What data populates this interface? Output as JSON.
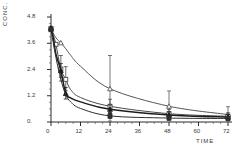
{
  "chart_data": {
    "type": "line",
    "title": "",
    "xlabel": "TIME",
    "ylabel": "CONC.",
    "xlim": [
      0,
      72
    ],
    "ylim": [
      0,
      4.8
    ],
    "xticks": [
      0,
      12,
      24,
      36,
      48,
      60,
      72
    ],
    "xtick_labels": [
      "0",
      "12",
      "24",
      "36",
      "48",
      "60",
      "72"
    ],
    "yticks": [
      0,
      1.2,
      2.4,
      3.6,
      4.8
    ],
    "ytick_labels": [
      "0.",
      "1.2",
      "2.4",
      "3.6",
      "4.8"
    ],
    "grid": false,
    "legend": "none",
    "x_minor_ticks": [
      3,
      6,
      9,
      15,
      18,
      21,
      27,
      30,
      33,
      39,
      42,
      45,
      51,
      54,
      57,
      63,
      66,
      69
    ],
    "y_minor_ticks": [
      0.3,
      0.6,
      0.9,
      1.5,
      1.8,
      2.1,
      2.7,
      3.0,
      3.3,
      3.9,
      4.2,
      4.5
    ],
    "series": [
      {
        "name": "curve-a",
        "marker": "open-triangle",
        "color": "#555555",
        "x": [
          0,
          2,
          4,
          6,
          8,
          12,
          24,
          48,
          72
        ],
        "y": [
          4.25,
          3.85,
          3.62,
          3.35,
          3.05,
          2.55,
          1.52,
          0.72,
          0.34
        ],
        "points_x": [
          0,
          4,
          24,
          48,
          72
        ],
        "points_y": [
          4.25,
          3.62,
          1.52,
          0.72,
          0.34
        ],
        "err_x": [
          24,
          48,
          72
        ],
        "err_lo": [
          1.48,
          0.66,
          0.3
        ],
        "err_hi": [
          1.52,
          0.7,
          0.36
        ]
      },
      {
        "name": "curve-b",
        "marker": "open-square",
        "color": "#4a4a4a",
        "x": [
          0,
          1,
          2,
          4,
          6,
          8,
          12,
          24,
          48,
          72
        ],
        "y": [
          4.28,
          3.95,
          3.55,
          2.42,
          1.95,
          1.48,
          1.12,
          0.72,
          0.38,
          0.26
        ],
        "points_x": [
          0,
          2,
          4,
          6,
          24,
          48,
          72
        ],
        "points_y": [
          4.28,
          3.55,
          2.42,
          1.95,
          0.72,
          0.38,
          0.26
        ],
        "err_x": [
          4,
          6,
          24,
          48,
          72
        ],
        "err_lo": [
          0.55,
          0.52,
          0.3,
          0.18,
          0.14
        ],
        "err_hi": [
          0.62,
          0.58,
          0.32,
          0.2,
          0.16
        ]
      },
      {
        "name": "curve-c",
        "marker": "filled-triangle",
        "color": "#1c1c1c",
        "x": [
          0,
          1,
          2,
          4,
          6,
          8,
          12,
          24,
          48,
          72
        ],
        "y": [
          4.3,
          3.8,
          3.1,
          2.35,
          1.3,
          1.1,
          0.92,
          0.58,
          0.32,
          0.22
        ],
        "points_x": [
          0,
          4,
          6,
          24,
          48,
          72
        ],
        "points_y": [
          4.3,
          2.35,
          1.3,
          0.58,
          0.32,
          0.22
        ],
        "err_x": [
          4,
          6,
          24,
          48,
          72
        ],
        "err_lo": [
          0.3,
          0.25,
          0.18,
          0.12,
          0.1
        ],
        "err_hi": [
          0.32,
          0.28,
          0.2,
          0.14,
          0.12
        ]
      },
      {
        "name": "curve-d",
        "marker": "filled-square",
        "color": "#2e2e2e",
        "x": [
          0,
          2,
          4,
          6,
          8,
          12,
          24,
          48,
          72
        ],
        "y": [
          4.22,
          2.95,
          1.95,
          1.25,
          0.92,
          0.62,
          0.28,
          0.18,
          0.16
        ],
        "points_x": [
          0,
          24,
          48,
          72
        ],
        "points_y": [
          4.22,
          0.28,
          0.18,
          0.16
        ],
        "err_x": [
          24,
          48,
          72
        ],
        "err_lo": [
          0.12,
          0.08,
          0.07
        ],
        "err_hi": [
          0.14,
          0.1,
          0.09
        ]
      }
    ]
  }
}
